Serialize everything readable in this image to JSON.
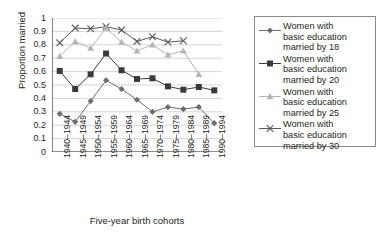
{
  "chart_data": {
    "type": "line",
    "title": "",
    "xlabel": "Five-year birth cohorts",
    "ylabel": "Proportion married",
    "ylim": [
      0,
      1
    ],
    "ytick_labels": [
      "1",
      "0.9",
      "0.8",
      "0.7",
      "0.6",
      "0.5",
      "0.4",
      "0.3",
      "0.2",
      "0.1",
      "0"
    ],
    "ytick_values": [
      1,
      0.9,
      0.8,
      0.7,
      0.6,
      0.5,
      0.4,
      0.3,
      0.2,
      0.1,
      0
    ],
    "grid": "horizontal",
    "legend_position": "right",
    "categories": [
      "1940–1944",
      "1945–1949",
      "1950–1954",
      "1955–1959",
      "1960–1964",
      "1965–1969",
      "1970–1974",
      "1975–1979",
      "1980–1984",
      "1985–1989",
      "1990–1994"
    ],
    "series": [
      {
        "name": "Women with basic education married by 18",
        "label_lines": [
          "Women with",
          "basic education",
          "married by 18"
        ],
        "marker": "diamond",
        "color": "#6d6e71",
        "values": [
          0.285,
          0.225,
          0.38,
          0.535,
          0.47,
          0.39,
          0.3,
          0.335,
          0.32,
          0.335,
          0.215
        ]
      },
      {
        "name": "Women with basic education married by 20",
        "label_lines": [
          "Women with",
          "basic education",
          "married by 20"
        ],
        "marker": "square",
        "color": "#3a3a3c",
        "values": [
          0.605,
          0.47,
          0.58,
          0.735,
          0.61,
          0.545,
          0.55,
          0.49,
          0.465,
          0.485,
          0.46
        ]
      },
      {
        "name": "Women with basic education married by 25",
        "label_lines": [
          "Women with",
          "basic education",
          "married by 25"
        ],
        "marker": "triangle",
        "color": "#b4b4b4",
        "values": [
          0.715,
          0.825,
          0.775,
          0.925,
          0.82,
          0.755,
          0.8,
          0.725,
          0.755,
          0.58,
          null
        ]
      },
      {
        "name": "Women with basic education married by 30",
        "label_lines": [
          "Women with",
          "basic education",
          "married by 30"
        ],
        "marker": "cross",
        "color": "#58595b",
        "values": [
          0.815,
          0.925,
          0.92,
          0.935,
          0.91,
          0.825,
          0.86,
          0.82,
          0.83,
          null,
          null
        ]
      }
    ]
  },
  "axis": {
    "ylabel": "Proportion married",
    "xlabel": "Five-year birth cohorts"
  },
  "legend": {
    "entries": [
      {
        "line1": "Women with",
        "line2": "basic education",
        "line3": "married by 18"
      },
      {
        "line1": "Women with",
        "line2": "basic education",
        "line3": "married by 20"
      },
      {
        "line1": "Women with",
        "line2": "basic education",
        "line3": "married by 25"
      },
      {
        "line1": "Women with",
        "line2": "basic education",
        "line3": "married by 30"
      }
    ]
  },
  "colors": {
    "axis": "#231f20",
    "grid": "#c9c9c9",
    "legend_border": "#8a8a8a"
  }
}
